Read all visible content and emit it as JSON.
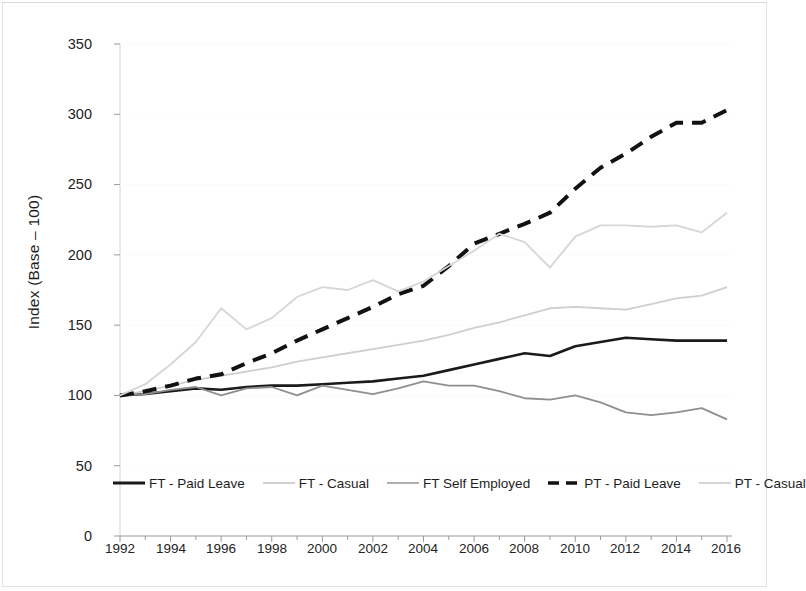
{
  "chart_data": {
    "type": "line",
    "title": "",
    "xlabel": "",
    "ylabel": "Index (Base – 100)",
    "xlim": [
      1992,
      2016
    ],
    "ylim": [
      0,
      350
    ],
    "grid": false,
    "legend_position": "bottom",
    "x": [
      1992,
      1993,
      1994,
      1995,
      1996,
      1997,
      1998,
      1999,
      2000,
      2001,
      2002,
      2003,
      2004,
      2005,
      2006,
      2007,
      2008,
      2009,
      2010,
      2011,
      2012,
      2013,
      2014,
      2015,
      2016
    ],
    "y_ticks": [
      0,
      50,
      100,
      150,
      200,
      250,
      300,
      350
    ],
    "x_tick_labels": [
      "1992",
      "1994",
      "1996",
      "1998",
      "2000",
      "2002",
      "2004",
      "2006",
      "2008",
      "2010",
      "2012",
      "2014",
      "2016"
    ],
    "series": [
      {
        "name": "FT - Paid Leave",
        "color": "#1a1a1a",
        "width": 2.6,
        "dash": "none",
        "values": [
          100,
          101,
          103,
          105,
          104,
          106,
          107,
          107,
          108,
          109,
          110,
          112,
          114,
          118,
          122,
          126,
          130,
          128,
          135,
          138,
          141,
          140,
          139,
          139,
          139
        ]
      },
      {
        "name": "FT - Casual",
        "color": "#cfcfcf",
        "width": 1.8,
        "dash": "none",
        "values": [
          100,
          103,
          107,
          111,
          114,
          117,
          120,
          124,
          127,
          130,
          133,
          136,
          139,
          143,
          148,
          152,
          157,
          162,
          163,
          162,
          161,
          165,
          169,
          171,
          177
        ]
      },
      {
        "name": "FT Self Employed",
        "color": "#8f8f8f",
        "width": 1.8,
        "dash": "none",
        "values": [
          100,
          101,
          104,
          106,
          100,
          105,
          106,
          100,
          107,
          104,
          101,
          105,
          110,
          107,
          107,
          103,
          98,
          97,
          100,
          95,
          88,
          86,
          88,
          91,
          83
        ]
      },
      {
        "name": "PT - Paid Leave",
        "color": "#121212",
        "width": 4.0,
        "dash": "14,9",
        "values": [
          100,
          103,
          107,
          112,
          115,
          123,
          130,
          139,
          147,
          155,
          163,
          172,
          178,
          192,
          208,
          215,
          222,
          230,
          247,
          262,
          272,
          284,
          294,
          294,
          303
        ]
      },
      {
        "name": "PT - Casual",
        "color": "#d6d6d6",
        "width": 1.8,
        "dash": "none",
        "values": [
          100,
          108,
          122,
          138,
          162,
          147,
          155,
          170,
          177,
          175,
          182,
          174,
          181,
          192,
          203,
          215,
          209,
          191,
          213,
          221,
          221,
          220,
          221,
          216,
          230
        ]
      }
    ]
  },
  "axis": {
    "y_tick_labels": [
      "350",
      "300",
      "250",
      "200",
      "150",
      "100",
      "50",
      "0"
    ],
    "y_axis_title": "Index (Base – 100)"
  },
  "legend": {
    "items": [
      {
        "label": "FT - Paid Leave",
        "swatch": "solid-thick-black"
      },
      {
        "label": "FT - Casual",
        "swatch": "solid-thin-lightgray"
      },
      {
        "label": "FT Self Employed",
        "swatch": "solid-thin-gray"
      },
      {
        "label": "PT - Paid Leave",
        "swatch": "dashed-thick-black"
      },
      {
        "label": "PT - Casual",
        "swatch": "solid-thin-lightgray"
      }
    ]
  }
}
